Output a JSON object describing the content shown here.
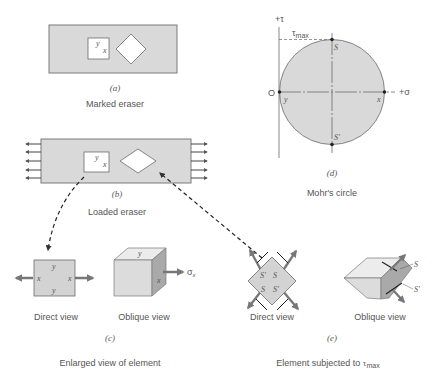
{
  "panels": {
    "a": {
      "label": "(a)",
      "caption": "Marked eraser",
      "square_labels": {
        "y": "y",
        "x": "x"
      }
    },
    "b": {
      "label": "(b)",
      "caption": "Loaded eraser",
      "square_labels": {
        "y": "y",
        "x": "x"
      }
    },
    "c": {
      "label": "(c)",
      "caption": "Enlarged view of element",
      "direct_view": {
        "caption": "Direct view",
        "labels": {
          "top": "y",
          "bottom": "y",
          "left": "x",
          "right": "x"
        }
      },
      "oblique_view": {
        "caption": "Oblique view",
        "labels": {
          "top": "y",
          "side": "x",
          "stress": "σ",
          "stress_sub": "x"
        }
      }
    },
    "d": {
      "label": "(d)",
      "caption": "Mohr's circle",
      "axes": {
        "tau": "+τ",
        "sigma": "+σ",
        "origin": "O"
      },
      "tau_max": {
        "symbol": "τ",
        "sub": "max"
      },
      "points": {
        "top": "S",
        "bottom": "S'",
        "left": "y",
        "right": "x"
      }
    },
    "e": {
      "label": "(e)",
      "caption_prefix": "Element subjected to ",
      "caption_symbol": "τ",
      "caption_sub": "max",
      "direct_view": {
        "caption": "Direct view",
        "labels": [
          "S'",
          "S",
          "S",
          "S'"
        ]
      },
      "oblique_view": {
        "caption": "Oblique view",
        "labels": {
          "top": "S",
          "bottom": "S'"
        }
      }
    }
  },
  "colors": {
    "fill_gray": "#d9d9d9",
    "stroke": "#6b6b6b",
    "arrow": "#777777",
    "text": "#555555"
  }
}
